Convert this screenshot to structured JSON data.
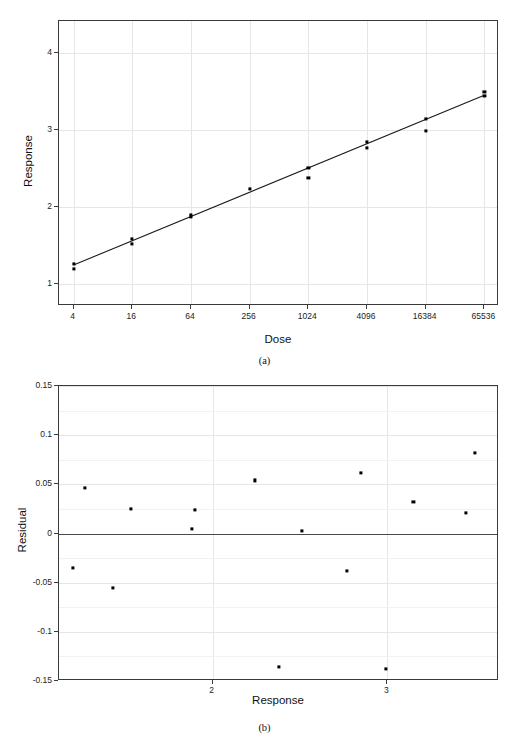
{
  "figure": {
    "panels": [
      {
        "caption": "(a)",
        "xlabel": "Dose",
        "ylabel": "Response"
      },
      {
        "caption": "(b)",
        "xlabel": "Response",
        "ylabel": "Residual"
      }
    ]
  },
  "chart_data": [
    {
      "type": "scatter",
      "panel": "(a)",
      "title": "",
      "xlabel": "Dose",
      "ylabel": "Response",
      "xscale": "log4",
      "xlim": [
        2.83,
        92682
      ],
      "ylim": [
        0.72,
        4.42
      ],
      "xticks": [
        4,
        16,
        64,
        256,
        1024,
        4096,
        16384,
        65536
      ],
      "xticklabels": [
        "4",
        "16",
        "64",
        "256",
        "1024",
        "4096",
        "16384",
        "65536"
      ],
      "yticks": [
        1,
        2,
        3,
        4
      ],
      "yticklabels": [
        "1",
        "2",
        "3",
        "4"
      ],
      "grid": true,
      "points": [
        {
          "dose": 4,
          "response": 1.27
        },
        {
          "dose": 4,
          "response": 1.2
        },
        {
          "dose": 16,
          "response": 1.59
        },
        {
          "dose": 16,
          "response": 1.53
        },
        {
          "dose": 64,
          "response": 1.9
        },
        {
          "dose": 64,
          "response": 1.88
        },
        {
          "dose": 256,
          "response": 2.24
        },
        {
          "dose": 1024,
          "response": 2.51
        },
        {
          "dose": 1024,
          "response": 2.38
        },
        {
          "dose": 4096,
          "response": 2.85
        },
        {
          "dose": 4096,
          "response": 2.77
        },
        {
          "dose": 16384,
          "response": 3.15
        },
        {
          "dose": 16384,
          "response": 2.99
        },
        {
          "dose": 65536,
          "response": 3.5
        },
        {
          "dose": 65536,
          "response": 3.45
        }
      ],
      "fit_line": {
        "label": "linear fit",
        "x": [
          4,
          65536
        ],
        "y": [
          1.23,
          3.44
        ]
      }
    },
    {
      "type": "scatter",
      "panel": "(b)",
      "title": "",
      "xlabel": "Response",
      "ylabel": "Residual",
      "xscale": "linear",
      "xlim": [
        1.12,
        3.64
      ],
      "ylim": [
        -0.15,
        0.15
      ],
      "xticks": [
        2,
        3
      ],
      "xticklabels": [
        "2",
        "3"
      ],
      "yticks": [
        0.15,
        0.1,
        0.05,
        0,
        -0.05,
        -0.1,
        -0.15
      ],
      "yticklabels": [
        "0.15",
        "0.1",
        "0.05",
        "0",
        "-0.05",
        "-0.1",
        "-0.15"
      ],
      "grid": true,
      "reference_line": 0,
      "points": [
        {
          "response": 1.2,
          "residual": -0.035
        },
        {
          "response": 1.27,
          "residual": 0.046
        },
        {
          "response": 1.43,
          "residual": -0.055
        },
        {
          "response": 1.53,
          "residual": 0.025
        },
        {
          "response": 1.88,
          "residual": 0.005
        },
        {
          "response": 1.9,
          "residual": 0.024
        },
        {
          "response": 2.24,
          "residual": 0.054
        },
        {
          "response": 2.38,
          "residual": -0.136
        },
        {
          "response": 2.51,
          "residual": 0.003
        },
        {
          "response": 2.77,
          "residual": -0.038
        },
        {
          "response": 2.85,
          "residual": 0.062
        },
        {
          "response": 2.99,
          "residual": -0.138
        },
        {
          "response": 3.15,
          "residual": 0.032
        },
        {
          "response": 3.45,
          "residual": 0.021
        },
        {
          "response": 3.5,
          "residual": 0.082
        }
      ]
    }
  ]
}
